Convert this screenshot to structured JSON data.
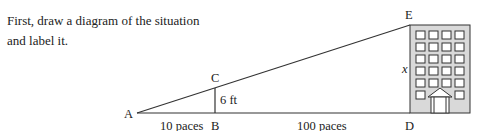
{
  "instruction": {
    "line1": "First, draw a diagram of the situation",
    "line2": "and label it."
  },
  "diagram": {
    "points": {
      "A": "A",
      "B": "B",
      "C": "C",
      "D": "D",
      "E": "E"
    },
    "labels": {
      "segment_AB": "10 paces",
      "segment_BD": "100 paces",
      "segment_BC": "6 ft",
      "segment_DE": "x"
    },
    "building": {
      "fill_color": "#d9d9d9",
      "window_rows": 6,
      "window_cols": 4
    }
  }
}
